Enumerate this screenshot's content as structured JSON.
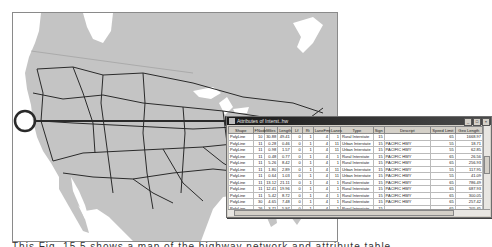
{
  "window": {
    "title": "Attributes of Interst..hw",
    "buttons": [
      "_",
      "□",
      "×"
    ]
  },
  "table": {
    "columns": [
      "Shape",
      "FNode",
      "Miles",
      "Length",
      "Lf",
      "Rt",
      "LaneFmt",
      "Lanes",
      "Type",
      "Sign",
      "Descript",
      "Speed Limit",
      "Geo Length"
    ],
    "rows": [
      [
        "PolyLine",
        "10",
        "30.88",
        "49.41",
        "0",
        "1",
        "4",
        "1",
        "Rural Interstate",
        "15",
        "",
        "65",
        "1668.97"
      ],
      [
        "PolyLine",
        "11",
        "0.28",
        "0.46",
        "0",
        "1",
        "4",
        "11",
        "Urban Interstate",
        "15",
        "PACIFIC HWY",
        "55",
        "18.71"
      ],
      [
        "PolyLine",
        "11",
        "0.98",
        "1.57",
        "0",
        "1",
        "4",
        "11",
        "Urban Interstate",
        "15",
        "PACIFIC HWY",
        "55",
        "62.85"
      ],
      [
        "PolyLine",
        "11",
        "0.48",
        "0.77",
        "0",
        "1",
        "4",
        "1",
        "Rural Interstate",
        "15",
        "PACIFIC HWY",
        "65",
        "26.56"
      ],
      [
        "PolyLine",
        "11",
        "5.26",
        "8.42",
        "0",
        "1",
        "4",
        "1",
        "Rural Interstate",
        "15",
        "PACIFIC HWY",
        "65",
        "256.93"
      ],
      [
        "PolyLine",
        "11",
        "1.80",
        "2.89",
        "0",
        "1",
        "4",
        "11",
        "Urban Interstate",
        "15",
        "PACIFIC HWY",
        "55",
        "117.95"
      ],
      [
        "PolyLine",
        "11",
        "0.64",
        "1.03",
        "0",
        "1",
        "4",
        "11",
        "Urban Interstate",
        "15",
        "PACIFIC HWY",
        "55",
        "41.09"
      ],
      [
        "PolyLine",
        "11",
        "13.12",
        "21.11",
        "0",
        "1",
        "4",
        "1",
        "Rural Interstate",
        "15",
        "PACIFIC HWY",
        "65",
        "786.49"
      ],
      [
        "PolyLine",
        "11",
        "12.41",
        "19.96",
        "0",
        "1",
        "4",
        "1",
        "Rural Interstate",
        "15",
        "PACIFIC HWY",
        "65",
        "687.93"
      ],
      [
        "PolyLine",
        "11",
        "5.42",
        "8.72",
        "0",
        "1",
        "4",
        "1",
        "Rural Interstate",
        "15",
        "PACIFIC HWY",
        "65",
        "300.05"
      ],
      [
        "PolyLine",
        "30",
        "4.65",
        "7.48",
        "0",
        "1",
        "4",
        "1",
        "Rural Interstate",
        "15",
        "PACIFIC HWY",
        "65",
        "257.42"
      ],
      [
        "PolyLine",
        "26",
        "3.71",
        "5.97",
        "0",
        "1",
        "4",
        "1",
        "Rural Interstate",
        "15",
        "",
        "65",
        "205.45"
      ],
      [
        "PolyLine",
        "107",
        "1.06",
        "1.71",
        "0",
        "1",
        "4",
        "11",
        "Urban Interstate",
        "15",
        "",
        "55",
        "59.65"
      ],
      [
        "PolyLine",
        "30",
        "0.84",
        "1.36",
        "0",
        "1",
        "4",
        "1",
        "Rural Interstate",
        "15",
        "PACIFIC HWY",
        "65",
        "35.79"
      ]
    ]
  },
  "map": {
    "land_color": "#c4c4c4",
    "road_color": "#2a2a2a",
    "water_color": "#ffffff",
    "highlight_circle": {
      "cx": 12,
      "cy": 108,
      "r": 10
    },
    "arrow": {
      "x1": 22,
      "y1": 108,
      "x2": 224,
      "y2": 108
    }
  },
  "caption": {
    "text": "This Fig. 15.5 shows a map of the highway network and attribute table"
  }
}
